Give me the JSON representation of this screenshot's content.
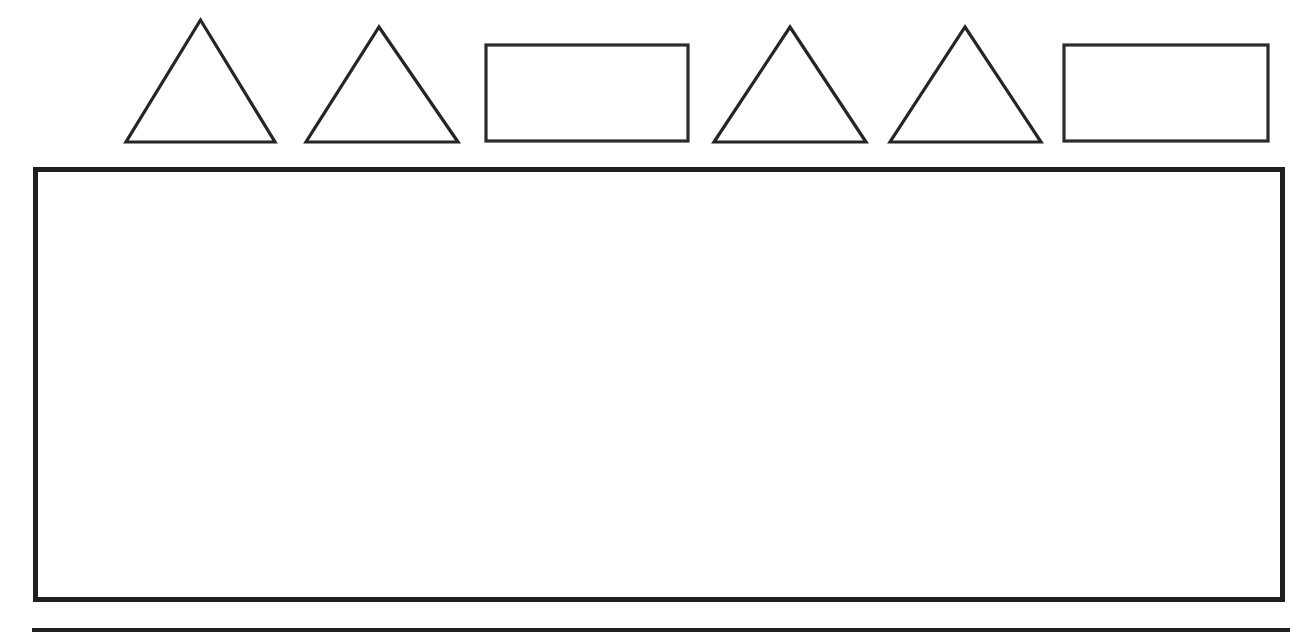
{
  "page": {
    "background_color": "#ffffff",
    "ink_color": "#1f1f1f",
    "width": 1312,
    "height": 640
  },
  "cropped_header": {
    "text": "",
    "note": "partially cropped line of text at the very top edge of the scan; only a single dark descender stroke is visible"
  },
  "shape_pattern": {
    "label": "",
    "count": 6,
    "stroke_color": "#252525",
    "fill_color": "#ffffff",
    "items": [
      {
        "index": 1,
        "type": "triangle",
        "name": "triangle",
        "left": 124,
        "top": 18,
        "width": 153,
        "height": 126
      },
      {
        "index": 2,
        "type": "triangle",
        "name": "triangle",
        "left": 304,
        "top": 25,
        "width": 156,
        "height": 119
      },
      {
        "index": 3,
        "type": "rectangle",
        "name": "rectangle",
        "left": 484,
        "top": 43,
        "width": 206,
        "height": 100
      },
      {
        "index": 4,
        "type": "triangle",
        "name": "triangle",
        "left": 712,
        "top": 25,
        "width": 156,
        "height": 119
      },
      {
        "index": 5,
        "type": "triangle",
        "name": "triangle",
        "left": 888,
        "top": 25,
        "width": 155,
        "height": 119
      },
      {
        "index": 6,
        "type": "rectangle",
        "name": "rectangle",
        "left": 1062,
        "top": 43,
        "width": 208,
        "height": 100
      }
    ]
  },
  "answer_box": {
    "content": "",
    "placeholder": "",
    "border_color": "#1f1f1f",
    "border_width": 5,
    "left": 33,
    "top": 167,
    "width": 1252,
    "height": 435
  },
  "bottom_rule": {
    "color": "#202020",
    "left": 32,
    "top": 628,
    "width": 1258,
    "height": 4
  }
}
